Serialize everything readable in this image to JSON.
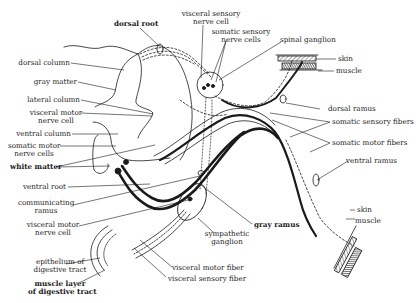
{
  "figure": {
    "labels": {
      "dorsal_root": "dorsal root",
      "visceral_sensory_nerve_cell_1": "visceral sensory",
      "visceral_sensory_nerve_cell_2": "nerve cell",
      "somatic_sensory_nerve_cells_1": "somatic sensory",
      "somatic_sensory_nerve_cells_2": "nerve cells",
      "spinal_ganglion": "spinal ganglion",
      "skin_top": "skin",
      "muscle_top": "muscle",
      "dorsal_column": "dorsal column",
      "gray_matter": "gray matter",
      "lateral_column": "lateral column",
      "visceral_motor_nerve_cell_cord_1": "visceral motor",
      "visceral_motor_nerve_cell_cord_2": "nerve cell",
      "ventral_column": "ventral column",
      "somatic_motor_nerve_cells_1": "somatic motor",
      "somatic_motor_nerve_cells_2": "nerve cells",
      "white_matter": "white matter",
      "dorsal_ramus": "dorsal ramus",
      "somatic_sensory_fibers": "somatic sensory fibers",
      "somatic_motor_fibers": "somatic motor fibers",
      "ventral_ramus": "ventral ramus",
      "ventral_root": "ventral root",
      "communicating_ramus_1": "communicating",
      "communicating_ramus_2": "ramus",
      "gray_ramus": "gray ramus",
      "skin_bottom": "skin",
      "muscle_bottom": "muscle",
      "visceral_motor_nerve_cell_ganglion_1": "visceral motor",
      "visceral_motor_nerve_cell_ganglion_2": "nerve cell",
      "sympathetic_ganglion_1": "sympathetic",
      "sympathetic_ganglion_2": "ganglion",
      "epithelium_1": "epithelium of",
      "epithelium_2": "digestive tract",
      "muscle_layer_1": "muscle layer",
      "muscle_layer_2": "of digestive tract",
      "visceral_motor_fiber": "visceral motor fiber",
      "visceral_sensory_fiber": "visceral sensory fiber"
    },
    "colors": {
      "ink": "#1a1a1a",
      "background": "#ffffff"
    }
  }
}
